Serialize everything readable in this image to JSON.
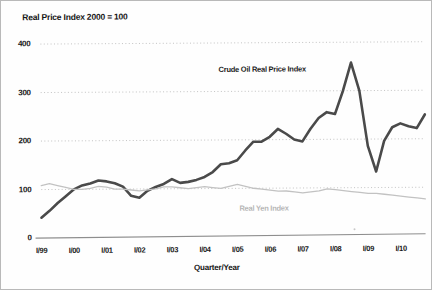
{
  "chart_data": {
    "type": "line",
    "title": "Real Price Index 2000 = 100",
    "xlabel": "Quarter/Year",
    "ylabel": "",
    "ylim": [
      0,
      400
    ],
    "yticks": [
      0,
      100,
      200,
      300,
      400
    ],
    "grid": "horizontal-dotted",
    "legend": "inline-annotations",
    "categories": [
      "I/99",
      "II/99",
      "III/99",
      "IV/99",
      "I/00",
      "II/00",
      "III/00",
      "IV/00",
      "I/01",
      "II/01",
      "III/01",
      "IV/01",
      "I/02",
      "II/02",
      "III/02",
      "IV/02",
      "I/03",
      "II/03",
      "III/03",
      "IV/03",
      "I/04",
      "II/04",
      "III/04",
      "IV/04",
      "I/05",
      "II/05",
      "III/05",
      "IV/05",
      "I/06",
      "II/06",
      "III/06",
      "IV/06",
      "I/07",
      "II/07",
      "III/07",
      "IV/07",
      "I/08",
      "II/08",
      "III/08",
      "IV/08",
      "I/09",
      "II/09",
      "III/09",
      "IV/09",
      "I/10",
      "II/10",
      "III/10",
      "IV/10"
    ],
    "xticks": [
      "I/99",
      "I/00",
      "I/01",
      "I/02",
      "I/03",
      "I/04",
      "I/05",
      "I/06",
      "I/07",
      "I/08",
      "I/09",
      "I/10"
    ],
    "series": [
      {
        "name": "Crude Oil Real Price Index",
        "color": "#4a4a4a",
        "values": [
          42,
          56,
          72,
          86,
          100,
          108,
          112,
          118,
          116,
          112,
          105,
          86,
          82,
          96,
          104,
          110,
          120,
          112,
          114,
          118,
          124,
          134,
          150,
          152,
          158,
          178,
          196,
          196,
          206,
          222,
          212,
          200,
          196,
          222,
          244,
          256,
          252,
          300,
          358,
          300,
          186,
          133,
          196,
          224,
          232,
          226,
          222,
          250
        ]
      },
      {
        "name": "Real Yen Index",
        "color": "#c2c2c2",
        "values": [
          108,
          112,
          108,
          104,
          100,
          100,
          102,
          106,
          104,
          100,
          100,
          98,
          96,
          98,
          100,
          104,
          104,
          102,
          100,
          102,
          104,
          102,
          100,
          104,
          108,
          104,
          100,
          98,
          96,
          94,
          94,
          92,
          90,
          92,
          94,
          98,
          96,
          94,
          92,
          90,
          88,
          88,
          86,
          84,
          82,
          80,
          78,
          76
        ]
      }
    ],
    "annotations": [
      {
        "text": "Crude Oil Real Price Index",
        "series": "Crude Oil Real Price Index"
      },
      {
        "text": "Real Yen Index",
        "series": "Real Yen Index"
      }
    ]
  }
}
